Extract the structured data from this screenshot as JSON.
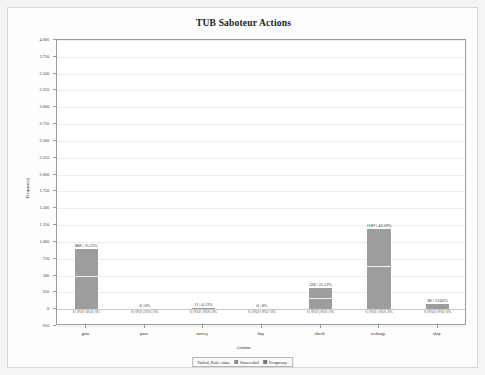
{
  "card": {
    "title": "TUB Saboteur Actions"
  },
  "chart_data": {
    "type": "bar",
    "title": "TUB Saboteur Actions",
    "xlabel": "Actions",
    "ylabel": "Frequency",
    "categories": [
      "goto",
      "pass",
      "survey",
      "buy",
      "check",
      "recharge",
      "skip"
    ],
    "values": [
      888,
      0,
      11,
      0,
      320,
      1187,
      80
    ],
    "percentages": [
      "35.25%",
      "0%",
      "0.13%",
      "0%",
      "25.12%",
      "42.59%",
      "13.02%"
    ],
    "top_labels": [
      "888 | 35.25%",
      "0 | 0%",
      "11 | 0.13%",
      "0 | 0%",
      "320 | 25.12%",
      "1187 | 42.59%",
      "80 | 13.02%"
    ],
    "base_labels": [
      "0 | 0%0 | 0%0 | 0%",
      "0 | 0%0 | 0%0 | 0%",
      "0 | 0%0 | 0%0 | 0%",
      "0 | 0%0 | 0%0 | 0%",
      "0 | 0%0 | 0%0 | 0%",
      "0 | 0%0 | 0%0 | 0%",
      "0 | 0%0 | 0%0 | 0%"
    ],
    "yticks": [
      "4.000",
      "3.750",
      "3.500",
      "3.250",
      "3.000",
      "2.750",
      "2.500",
      "2.250",
      "2.000",
      "1.750",
      "1.500",
      "1.250",
      "1.000",
      "750",
      "500",
      "250",
      "0",
      "-250"
    ],
    "ytick_values": [
      4000,
      3750,
      3500,
      3250,
      3000,
      2750,
      2500,
      2250,
      2000,
      1750,
      1500,
      1250,
      1000,
      750,
      500,
      250,
      0,
      -250
    ],
    "ylim": [
      -250,
      4000
    ],
    "grid": true,
    "legend_position": "bottom",
    "bar_color": "#9d9d9d",
    "series": [
      {
        "name": "Failed_Role: none",
        "values": [
          888,
          0,
          11,
          0,
          320,
          1187,
          80
        ]
      },
      {
        "name": "Succeeded",
        "values": [
          0,
          0,
          0,
          0,
          0,
          0,
          0
        ]
      },
      {
        "name": "Frequency",
        "values": [
          0,
          0,
          0,
          0,
          0,
          0,
          0
        ]
      }
    ]
  },
  "legend": {
    "items": [
      {
        "label": "Failed_Role: none",
        "color": "#9d9d9d"
      },
      {
        "label": "Succeeded",
        "color": "#8c8c8c"
      },
      {
        "label": "Frequency",
        "color": "#777777"
      }
    ]
  }
}
